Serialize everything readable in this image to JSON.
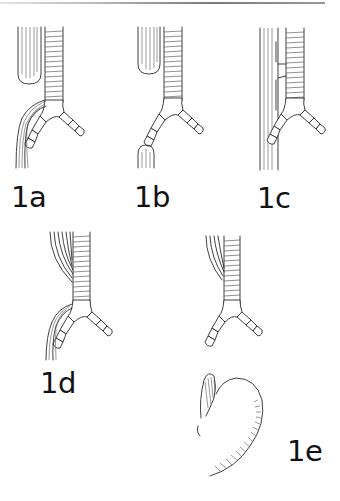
{
  "figure": {
    "panels": [
      {
        "id": "1a",
        "label": "1a",
        "description": "Proximal esophageal pouch with distal tracheoesophageal fistula"
      },
      {
        "id": "1b",
        "label": "1b",
        "description": "Isolated esophageal atresia (proximal and distal pouches, no fistula)"
      },
      {
        "id": "1c",
        "label": "1c",
        "description": "H-type tracheoesophageal fistula without atresia"
      },
      {
        "id": "1d",
        "label": "1d",
        "description": "Proximal and distal tracheoesophageal fistulas"
      },
      {
        "id": "1e",
        "label": "1e",
        "description": "Proximal fistula with distal esophageal pouch / stomach"
      }
    ]
  },
  "colors": {
    "ink": "#2a2a2a",
    "background": "#ffffff",
    "label": "#111111"
  }
}
